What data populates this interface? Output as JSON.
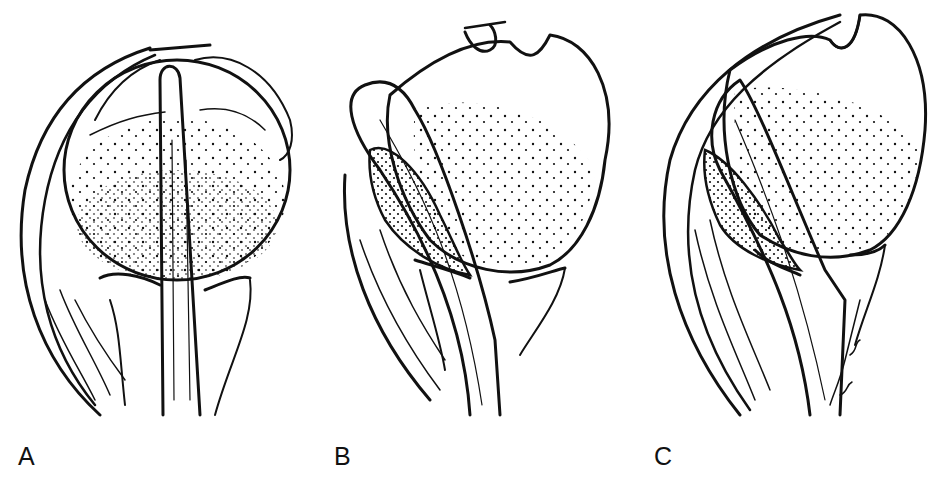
{
  "figure": {
    "background": "#ffffff",
    "ink_color": "#111111",
    "panels": [
      {
        "id": "A",
        "label": "A",
        "description": "Anterior view of humeral head with biceps tendon centered in the bicipital groove"
      },
      {
        "id": "B",
        "label": "B",
        "description": "Biceps tendon displaced medially out of the groove, looping over the lesser tuberosity"
      },
      {
        "id": "C",
        "label": "C",
        "description": "Biceps tendon dislocated medially with overlying soft tissue sheath"
      }
    ]
  }
}
